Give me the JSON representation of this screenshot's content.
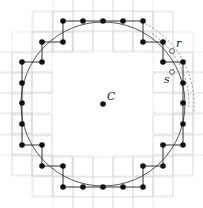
{
  "diagram": {
    "center": {
      "label": "C",
      "x": 103,
      "y": 104
    },
    "circle_radius": 82,
    "grid_cell": 20,
    "boundary_points": [
      [
        63,
        21
      ],
      [
        83,
        21
      ],
      [
        103,
        21
      ],
      [
        123,
        21
      ],
      [
        143,
        21
      ],
      [
        143,
        42
      ],
      [
        163,
        42
      ],
      [
        163,
        62
      ],
      [
        183,
        62
      ],
      [
        183,
        83
      ],
      [
        183,
        103
      ],
      [
        183,
        124
      ],
      [
        183,
        145
      ],
      [
        163,
        145
      ],
      [
        163,
        166
      ],
      [
        143,
        166
      ],
      [
        143,
        187
      ],
      [
        123,
        187
      ],
      [
        103,
        187
      ],
      [
        83,
        187
      ],
      [
        63,
        187
      ],
      [
        63,
        166
      ],
      [
        42,
        166
      ],
      [
        42,
        145
      ],
      [
        22,
        145
      ],
      [
        22,
        124
      ],
      [
        22,
        103
      ],
      [
        22,
        83
      ],
      [
        22,
        62
      ],
      [
        42,
        62
      ],
      [
        42,
        42
      ],
      [
        63,
        42
      ]
    ],
    "marked_points": [
      {
        "label": "r",
        "x": 172,
        "y": 51,
        "label_x": 176,
        "label_y": 47
      },
      {
        "label": "s",
        "x": 172,
        "y": 72,
        "label_x": 164,
        "label_y": 83
      }
    ],
    "dashed_arcs": [
      {
        "radius": 91,
        "start_deg": -62,
        "end_deg": 5
      },
      {
        "radius": 86,
        "start_deg": -55,
        "end_deg": 2
      }
    ],
    "colors": {
      "line": "#333333",
      "grid": "#cfcfcf",
      "dot": "#111111",
      "circle": "#555555"
    }
  }
}
